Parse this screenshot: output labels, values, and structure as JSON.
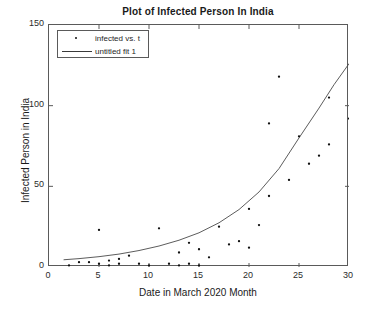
{
  "chart_data": {
    "type": "scatter",
    "title": "Plot of Infected Person In India",
    "xlabel": "Date in March 2020 Month",
    "ylabel": "Infected Person in India",
    "xlim": [
      0,
      30
    ],
    "ylim": [
      0,
      150
    ],
    "xticks": [
      0,
      5,
      10,
      15,
      20,
      25,
      30
    ],
    "yticks": [
      0,
      50,
      100,
      150
    ],
    "grid": false,
    "legend_position": "upper-left",
    "legend": [
      {
        "label": "infected vs. t",
        "marker": "dot"
      },
      {
        "label": "untitled fit 1",
        "marker": "line"
      }
    ],
    "series": [
      {
        "name": "infected vs. t",
        "type": "scatter",
        "marker": "dot",
        "color": "#111111",
        "points": [
          {
            "x": 2,
            "y": 1
          },
          {
            "x": 3,
            "y": 3
          },
          {
            "x": 4,
            "y": 3
          },
          {
            "x": 5,
            "y": 23
          },
          {
            "x": 5,
            "y": 2
          },
          {
            "x": 6,
            "y": 4
          },
          {
            "x": 6,
            "y": 1
          },
          {
            "x": 7,
            "y": 5
          },
          {
            "x": 7,
            "y": 2
          },
          {
            "x": 8,
            "y": 7
          },
          {
            "x": 9,
            "y": 2
          },
          {
            "x": 10,
            "y": 1
          },
          {
            "x": 11,
            "y": 24
          },
          {
            "x": 12,
            "y": 2
          },
          {
            "x": 13,
            "y": 9
          },
          {
            "x": 13,
            "y": 1
          },
          {
            "x": 14,
            "y": 15
          },
          {
            "x": 14,
            "y": 2
          },
          {
            "x": 15,
            "y": 11
          },
          {
            "x": 15,
            "y": 1
          },
          {
            "x": 16,
            "y": 6
          },
          {
            "x": 17,
            "y": 25
          },
          {
            "x": 18,
            "y": 14
          },
          {
            "x": 19,
            "y": 16
          },
          {
            "x": 20,
            "y": 36
          },
          {
            "x": 20,
            "y": 12
          },
          {
            "x": 21,
            "y": 26
          },
          {
            "x": 22,
            "y": 44
          },
          {
            "x": 22,
            "y": 89
          },
          {
            "x": 23,
            "y": 118
          },
          {
            "x": 24,
            "y": 54
          },
          {
            "x": 25,
            "y": 81
          },
          {
            "x": 26,
            "y": 64
          },
          {
            "x": 27,
            "y": 69
          },
          {
            "x": 28,
            "y": 76
          },
          {
            "x": 28,
            "y": 105
          },
          {
            "x": 30,
            "y": 92
          }
        ]
      },
      {
        "name": "untitled fit 1",
        "type": "line",
        "color": "#4a4a4a",
        "description": "exponential fit curve",
        "points": [
          {
            "x": 1.5,
            "y": 4.5
          },
          {
            "x": 3,
            "y": 5.2
          },
          {
            "x": 5,
            "y": 6.4
          },
          {
            "x": 7,
            "y": 8.0
          },
          {
            "x": 9,
            "y": 10.2
          },
          {
            "x": 11,
            "y": 13.0
          },
          {
            "x": 13,
            "y": 16.6
          },
          {
            "x": 15,
            "y": 21.2
          },
          {
            "x": 17,
            "y": 27.4
          },
          {
            "x": 19,
            "y": 35.6
          },
          {
            "x": 21,
            "y": 46.5
          },
          {
            "x": 23,
            "y": 61.0
          },
          {
            "x": 25,
            "y": 80.0
          },
          {
            "x": 27,
            "y": 98.5
          },
          {
            "x": 28.5,
            "y": 113.0
          },
          {
            "x": 30,
            "y": 126.0
          }
        ]
      }
    ]
  }
}
